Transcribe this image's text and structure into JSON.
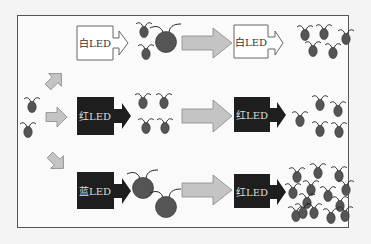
{
  "diagram": {
    "title": "",
    "colors": {
      "frame_border": "#555555",
      "white_led_fill": "#ffffff",
      "dark_led_fill": "#1e1e1e",
      "grey_arrow": "#c4c4c4",
      "algae_cell": "#555555"
    },
    "rows": [
      {
        "name": "white-led-row",
        "stage1": {
          "label": "白LED",
          "style": "white",
          "cells_after": 3,
          "cell_size": "large-mixed"
        },
        "stage2": {
          "label": "白LED",
          "style": "white",
          "cells_after": 5
        }
      },
      {
        "name": "red-led-row",
        "stage1": {
          "label": "红LED",
          "style": "dark",
          "cells_after": 4,
          "cell_size": "small"
        },
        "stage2": {
          "label": "红LED",
          "style": "dark",
          "cells_after": 5
        }
      },
      {
        "name": "blue-led-row",
        "stage1": {
          "label": "蓝LED",
          "style": "dark",
          "cells_after": 2,
          "cell_size": "large"
        },
        "stage2": {
          "label": "红LED",
          "style": "dark",
          "cells_after": 14
        }
      }
    ],
    "start_cells": 2,
    "labels": {
      "r1s1": "白LED",
      "r1s2": "白LED",
      "r2s1": "红LED",
      "r2s2": "红LED",
      "r3s1": "蓝LED",
      "r3s2": "红LED"
    }
  }
}
